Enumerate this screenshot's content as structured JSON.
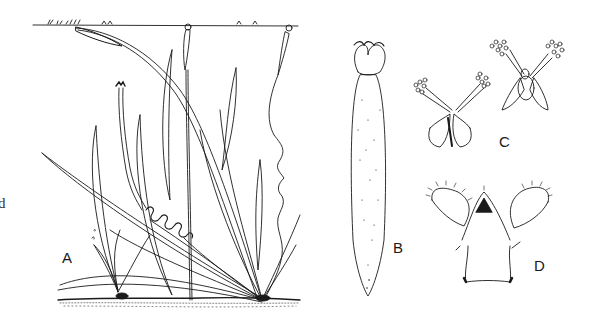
{
  "figure": {
    "panels": [
      {
        "id": "A",
        "label": "A",
        "description": "whole plants rooted in substrate, long strap leaves, floating flowers on water surface, coiled peduncles"
      },
      {
        "id": "B",
        "label": "B",
        "description": "elongated stippled ovary with flower at top"
      },
      {
        "id": "C",
        "label": "C",
        "description": "two flowers with spreading stamens bearing clustered anthers"
      },
      {
        "id": "D",
        "label": "D",
        "description": "flower with hairy reflexed petals"
      }
    ],
    "edge_glyph": "d"
  },
  "colors": {
    "background": "#ffffff",
    "ink": "#1a1a1a"
  }
}
